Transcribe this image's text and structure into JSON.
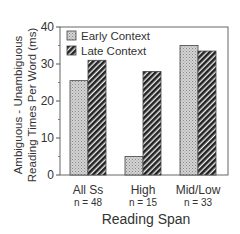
{
  "chart_data": {
    "type": "bar",
    "title": "",
    "xlabel": "Reading Span",
    "ylabel_lines": [
      "Ambiguous - Unambiguous",
      "Reading Times Per Word (ms)"
    ],
    "ylabel": "Ambiguous - Unambiguous Reading Times Per Word (ms)",
    "ylim": [
      0,
      40
    ],
    "yticks": [
      0,
      10,
      20,
      30,
      40
    ],
    "categories": [
      "All Ss",
      "High",
      "Mid/Low"
    ],
    "category_sublabels": [
      "n = 48",
      "n = 15",
      "n = 33"
    ],
    "series": [
      {
        "name": "Early Context",
        "values": [
          25.5,
          5,
          35
        ],
        "pattern": "stipple",
        "color": "#c8c8c8"
      },
      {
        "name": "Late Context",
        "values": [
          31,
          28,
          33.5
        ],
        "pattern": "hatch",
        "color": "#333333"
      }
    ],
    "legend_position": "top-left inside",
    "grid": false
  }
}
